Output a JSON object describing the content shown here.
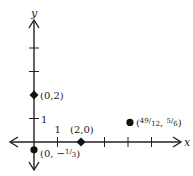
{
  "diagram": {
    "type": "coordinate-plane",
    "x_axis_label": "x",
    "y_axis_label": "y",
    "x_range": [
      -1,
      6
    ],
    "y_range": [
      -0.5,
      5.5
    ],
    "x_ticks": [
      1,
      2,
      3,
      4,
      5
    ],
    "y_ticks": [
      1,
      2,
      3,
      4
    ],
    "x_tick_labels": [
      {
        "value": 1,
        "label": "1"
      }
    ],
    "y_tick_labels": [
      {
        "value": 1,
        "label": "1"
      }
    ],
    "colors": {
      "axis": "#222222",
      "point": "#111111",
      "text": "#222222"
    },
    "points": [
      {
        "name": "point-0-2",
        "x": 0,
        "y": 2,
        "label": "(0,2)",
        "marker": "diamond"
      },
      {
        "name": "point-2-0",
        "x": 2,
        "y": 0,
        "label": "(2,0)",
        "marker": "diamond"
      },
      {
        "name": "point-0-neg-third",
        "x": 0,
        "y": -0.3333,
        "label_pre": "(0, −",
        "label_num": "1",
        "label_den": "3",
        "label_post": ")",
        "marker": "circle"
      },
      {
        "name": "point-49-12-5-6",
        "x": 4.0833,
        "y": 0.8333,
        "label_pre": "(",
        "label_num": "49",
        "label_den": "12",
        "label_mid": ", ",
        "label_num2": "5",
        "label_den2": "6",
        "label_post": ")",
        "marker": "circle"
      }
    ]
  }
}
